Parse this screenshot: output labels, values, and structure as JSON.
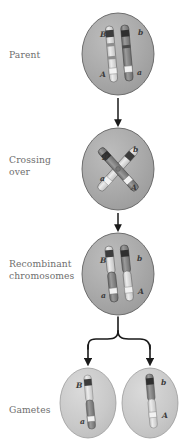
{
  "figure": {
    "background_color": "#ffffff",
    "cell_fill": "#a8a8a8",
    "cell_stroke": "#555555",
    "gamete_fill": "#c9c9c9",
    "gamete_stroke": "#8a8a8a",
    "chromatid_light": "#d8d8d8",
    "chromatid_dark": "#7a7a7a",
    "band_dark": "#3c3c3c",
    "band_light": "#f2f2f2",
    "arrow_color": "#1a1a1a",
    "label_color": "#6e6e6e"
  },
  "stages": [
    {
      "id": "parent",
      "label": "Parent",
      "cell": {
        "cx": 118,
        "cy": 54,
        "rx": 36,
        "ry": 41
      },
      "chromosome_labels": [
        {
          "text": "B",
          "x": 100,
          "y": 37
        },
        {
          "text": "b",
          "x": 138,
          "y": 35
        },
        {
          "text": "A",
          "x": 103,
          "y": 76
        },
        {
          "text": "a",
          "x": 138,
          "y": 75
        }
      ]
    },
    {
      "id": "crossing-over",
      "label": "Crossing\nover",
      "cell": {
        "cx": 118,
        "cy": 169,
        "rx": 36,
        "ry": 41
      },
      "chromosome_labels": [
        {
          "text": "B",
          "x": 104,
          "y": 159
        },
        {
          "text": "b",
          "x": 134,
          "y": 152
        },
        {
          "text": "a",
          "x": 102,
          "y": 180
        },
        {
          "text": "A",
          "x": 131,
          "y": 188
        }
      ]
    },
    {
      "id": "recombinant",
      "label": "Recombinant\nchromosomes",
      "cell": {
        "cx": 118,
        "cy": 274,
        "rx": 36,
        "ry": 41
      },
      "chromosome_labels": [
        {
          "text": "B",
          "x": 101,
          "y": 262
        },
        {
          "text": "b",
          "x": 137,
          "y": 261
        },
        {
          "text": "a",
          "x": 103,
          "y": 297
        },
        {
          "text": "A",
          "x": 139,
          "y": 294
        }
      ]
    },
    {
      "id": "gametes",
      "label": "Gametes",
      "cells": [
        {
          "cx": 88,
          "cy": 403,
          "rx": 28,
          "ry": 35
        },
        {
          "cx": 150,
          "cy": 403,
          "rx": 28,
          "ry": 35
        }
      ],
      "chromosome_labels": [
        {
          "text": "B",
          "x": 77,
          "y": 386
        },
        {
          "text": "a",
          "x": 83,
          "y": 423
        },
        {
          "text": "b",
          "x": 162,
          "y": 384
        },
        {
          "text": "A",
          "x": 163,
          "y": 417
        }
      ]
    }
  ],
  "connectors": [
    {
      "id": "arrow-parent-to-crossing",
      "type": "arrow-down",
      "x": 118,
      "y_start": 97,
      "y_end": 126
    },
    {
      "id": "arrow-crossing-to-recombinant",
      "type": "arrow-down",
      "x": 118,
      "y_start": 212,
      "y_end": 231
    },
    {
      "id": "bracket-recombinant-to-gametes",
      "type": "split-bracket",
      "x": 118,
      "y_start": 317,
      "y_end": 363,
      "branch_left_x": 88,
      "branch_right_x": 150
    }
  ]
}
